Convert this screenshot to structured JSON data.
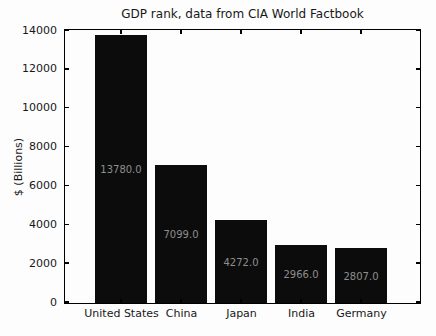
{
  "chart_data": {
    "type": "bar",
    "title": "GDP rank, data from CIA World Factbook",
    "xlabel": "",
    "ylabel": "$ (Billions)",
    "categories": [
      "United States",
      "China",
      "Japan",
      "India",
      "Germany"
    ],
    "values": [
      13780.0,
      7099.0,
      4272.0,
      2966.0,
      2807.0
    ],
    "value_labels": [
      "13780.0",
      "7099.0",
      "4272.0",
      "2966.0",
      "2807.0"
    ],
    "ylim": [
      0,
      14000
    ],
    "yticks": [
      0,
      2000,
      4000,
      6000,
      8000,
      10000,
      12000,
      14000
    ],
    "grid": false,
    "legend": null,
    "tick_direction": "in",
    "bar_color": "#0c0c0c",
    "value_label_color": "#8e8e8e",
    "text_color": "#181818",
    "background_color": "#fdfdfd"
  }
}
